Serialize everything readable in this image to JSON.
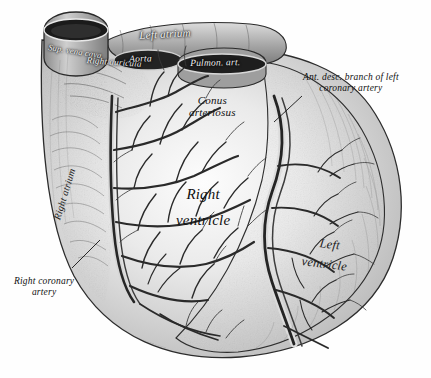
{
  "figure": {
    "style": "grayscale anatomical engraving",
    "background_color": "#fefefe",
    "ink_color": "#101010"
  },
  "labels": {
    "superior_vena_cava": "Sup. vena cava",
    "left_atrium": "Left atrium",
    "right_auricula": "Right auricula",
    "aorta": "Aorta",
    "pulmonary_artery": "Pulmon. art.",
    "conus_arteriosus_line1": "Conus",
    "conus_arteriosus_line2": "arteriosus",
    "right_atrium": "Right atrium",
    "right_ventricle_line1": "Right",
    "right_ventricle_line2": "ventricle",
    "left_ventricle_line1": "Left",
    "left_ventricle_line2": "ventricle",
    "ant_desc_branch_line1": "Ant. desc. branch of left",
    "ant_desc_branch_line2": "coronary artery",
    "right_coronary_line1": "Right coronary",
    "right_coronary_line2": "artery"
  }
}
